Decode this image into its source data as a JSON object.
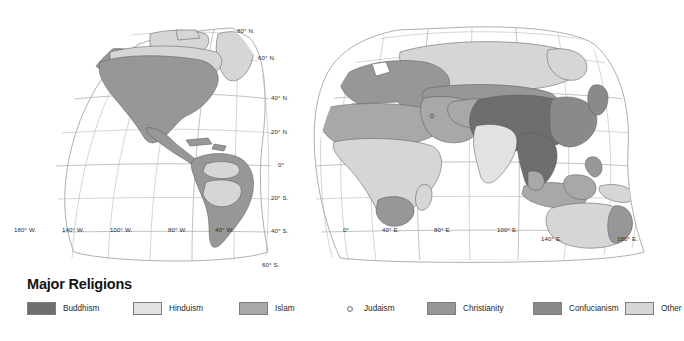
{
  "legend": {
    "title": "Major Religions",
    "items": [
      {
        "label": "Buddhism",
        "color": "#6e6e6e",
        "symbol": "swatch",
        "x": 0
      },
      {
        "label": "Hinduism",
        "color": "#e2e2e2",
        "symbol": "swatch",
        "x": 106
      },
      {
        "label": "Islam",
        "color": "#a8a8a8",
        "symbol": "swatch",
        "x": 212
      },
      {
        "label": "Judaism",
        "color": "#ffffff",
        "symbol": "point",
        "x": 318
      },
      {
        "label": "Christianity",
        "color": "#979797",
        "symbol": "swatch",
        "x": 400
      },
      {
        "label": "Confucianism",
        "color": "#8a8a8a",
        "symbol": "swatch",
        "x": 506
      },
      {
        "label": "Other",
        "color": "#d6d6d6",
        "symbol": "swatch",
        "x": 598
      }
    ]
  },
  "map": {
    "projection": "interrupted-pseudocylindrical-two-lobe",
    "ocean_color": "#ffffff",
    "graticule_color": "#b9b9b9",
    "coastline_color": "#5d5d5d",
    "latitude_labels": [
      {
        "text": "80° N.",
        "x": 237,
        "y": 33
      },
      {
        "text": "60° N.",
        "x": 258,
        "y": 60
      },
      {
        "text": "40° N.",
        "x": 271,
        "y": 99
      },
      {
        "text": "20° N.",
        "x": 271,
        "y": 133
      },
      {
        "text": "0°",
        "x": 278,
        "y": 166
      },
      {
        "text": "20° S.",
        "x": 271,
        "y": 199
      },
      {
        "text": "40° S.",
        "x": 271,
        "y": 232
      },
      {
        "text": "60° S.",
        "x": 262,
        "y": 268
      }
    ],
    "longitude_labels_west": [
      {
        "text": "180° W.",
        "x": 14,
        "y": 232
      },
      {
        "text": "140° W.",
        "x": 62,
        "y": 232
      },
      {
        "text": "100° W.",
        "x": 110,
        "y": 232
      },
      {
        "text": "80° W.",
        "x": 168,
        "y": 232
      },
      {
        "text": "40° W.",
        "x": 215,
        "y": 232
      }
    ],
    "longitude_labels_east": [
      {
        "text": "0°",
        "x": 343,
        "y": 232
      },
      {
        "text": "40° E.",
        "x": 382,
        "y": 232
      },
      {
        "text": "80° E.",
        "x": 434,
        "y": 232
      },
      {
        "text": "100° E.",
        "x": 497,
        "y": 232
      },
      {
        "text": "140° E.",
        "x": 541,
        "y": 240
      },
      {
        "text": "180° E.",
        "x": 617,
        "y": 240
      }
    ],
    "regions": [
      {
        "name": "North America",
        "religion": "Christianity"
      },
      {
        "name": "Canadian Arctic",
        "religion": "Other"
      },
      {
        "name": "Greenland",
        "religion": "Other"
      },
      {
        "name": "South America",
        "religion": "Christianity"
      },
      {
        "name": "Amazon Basin",
        "religion": "Other"
      },
      {
        "name": "Europe",
        "religion": "Christianity"
      },
      {
        "name": "Russia",
        "religion": "Other"
      },
      {
        "name": "North Africa",
        "religion": "Islam"
      },
      {
        "name": "Sub-Saharan Africa",
        "religion": "Other"
      },
      {
        "name": "Southern Africa",
        "religion": "Christianity"
      },
      {
        "name": "Middle East",
        "religion": "Islam"
      },
      {
        "name": "Central Asia",
        "religion": "Islam"
      },
      {
        "name": "India",
        "religion": "Hinduism"
      },
      {
        "name": "China / Mongolia",
        "religion": "Buddhism"
      },
      {
        "name": "East Asia Coast",
        "religion": "Confucianism"
      },
      {
        "name": "Southeast Asia",
        "religion": "Buddhism"
      },
      {
        "name": "Indonesia / Malaysia",
        "religion": "Islam"
      },
      {
        "name": "Philippines",
        "religion": "Christianity"
      },
      {
        "name": "Australia",
        "religion": "Other"
      },
      {
        "name": "New Zealand",
        "religion": "Christianity"
      }
    ]
  }
}
